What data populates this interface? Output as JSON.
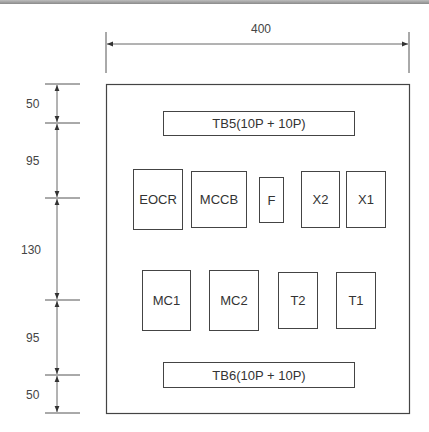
{
  "diagram": {
    "width_dimension": "400",
    "vertical_dimensions": [
      "50",
      "95",
      "130",
      "95",
      "50"
    ],
    "terminal_blocks": {
      "top": "TB5(10P + 10P)",
      "bottom": "TB6(10P + 10P)"
    },
    "upper_row": [
      "EOCR",
      "MCCB",
      "F",
      "X2",
      "X1"
    ],
    "lower_row": [
      "MC1",
      "MC2",
      "T2",
      "T1"
    ]
  }
}
